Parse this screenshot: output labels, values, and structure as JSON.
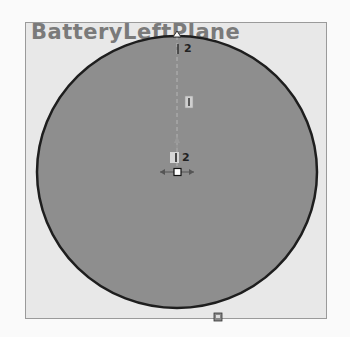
{
  "viewport": {
    "plane_name": "BatteryLeftPlane",
    "colors": {
      "plane_fill": "#e8e8e8",
      "circle_fill": "#8e8e8e",
      "circle_stroke": "#1e1e1e",
      "label": "#7a7a7a"
    },
    "sketch": {
      "circle": {
        "cx": 177,
        "cy": 172,
        "rx": 140,
        "ry": 136
      },
      "relation_labels": [
        {
          "id": "top-point-relation",
          "text": "2"
        },
        {
          "id": "center-relation",
          "text": "2"
        }
      ]
    }
  }
}
